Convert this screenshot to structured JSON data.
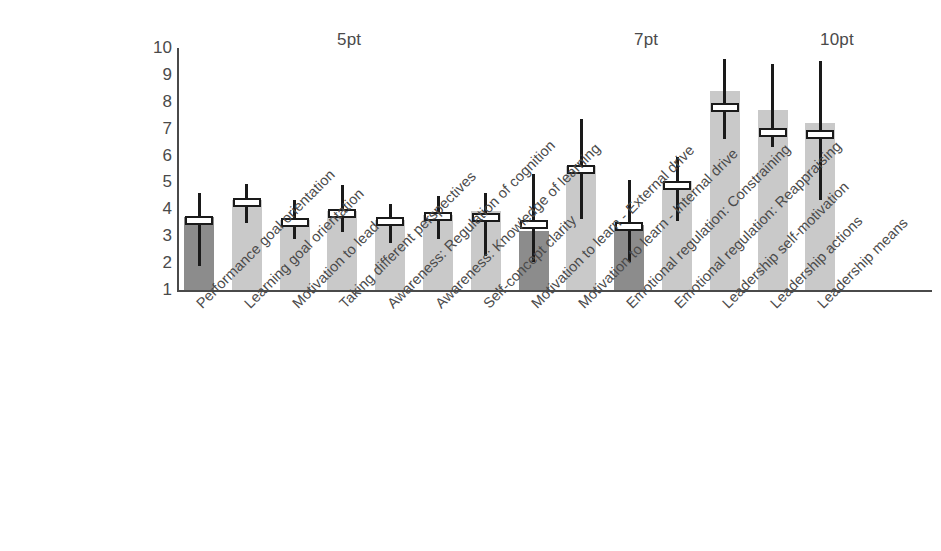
{
  "chart_data": {
    "type": "bar",
    "title": "",
    "subtitle": "",
    "xlabel": "",
    "ylabel": "",
    "ylim": [
      1,
      10
    ],
    "yticks": [
      "10",
      "9",
      "8",
      "7",
      "6",
      "5",
      "4",
      "3",
      "2",
      "1"
    ],
    "grid": false,
    "legend": "none",
    "group_labels": [
      {
        "label": "5pt",
        "x": 337
      },
      {
        "label": "7pt",
        "x": 634
      },
      {
        "label": "10pt",
        "x": 820
      }
    ],
    "categories": [
      "Performance goal orientation",
      "Learning goal orientation",
      "Motivation to lead",
      "Taking different perspectives",
      "Awareness: Regulation of cognition",
      "Awareness: Knowledge of learning",
      "Self-concept clarity",
      "Motivation to learn - External drive",
      "Motivation to learn - Internal drive",
      "Emotional regulation: Constraining",
      "Emotional regulation: Reappraising",
      "Leadership self-motivation",
      "Leadership actions",
      "Leadership means"
    ],
    "values": [
      3.7,
      4.35,
      3.6,
      3.95,
      3.6,
      3.8,
      3.95,
      3.2,
      5.6,
      3.4,
      5.05,
      8.4,
      7.7,
      7.2
    ],
    "marker": [
      3.6,
      4.25,
      3.5,
      3.85,
      3.55,
      3.75,
      3.7,
      3.45,
      5.5,
      3.35,
      4.9,
      7.8,
      6.85,
      6.8
    ],
    "whisker_low": [
      1.9,
      3.5,
      2.9,
      3.15,
      2.75,
      2.9,
      2.25,
      2.05,
      3.65,
      2.05,
      3.55,
      6.6,
      6.3,
      4.35
    ],
    "whisker_high": [
      4.6,
      4.95,
      4.35,
      4.9,
      4.2,
      4.5,
      4.6,
      5.3,
      7.35,
      5.1,
      5.95,
      9.6,
      9.4,
      9.5
    ],
    "shades": [
      "dark",
      "light",
      "light",
      "light",
      "light",
      "light",
      "light",
      "dark",
      "light",
      "dark",
      "light",
      "light",
      "light",
      "light"
    ],
    "colors": {
      "bar_light": "#c9c9c9",
      "bar_dark": "#8c8c8c",
      "whisker": "#1a1a1a",
      "marker_fill": "#ffffff",
      "marker_stroke": "#1a1a1a",
      "axis": "#4a4a4a",
      "text": "#4a4a4a",
      "background": "#ffffff"
    }
  }
}
